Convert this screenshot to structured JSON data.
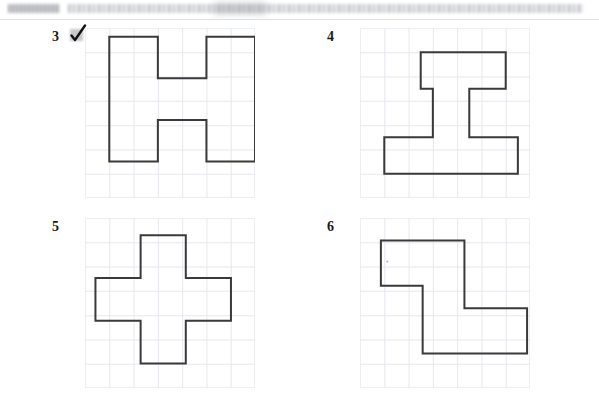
{
  "document": {
    "type": "scanned-worksheet",
    "page_background": "#ffffff",
    "header": {
      "redacted": true,
      "tag_band_label": "",
      "title_band_label": "",
      "note": "header text illegible in scan"
    },
    "ink_color": "#3a3a3a",
    "grid_line_color": "#e6e8ee",
    "grid_border_color": "#eceef3"
  },
  "annotations": {
    "check_mark": {
      "name": "check-mark",
      "near_item": "3",
      "color": "#111111",
      "highlight_color": "#787c82"
    }
  },
  "figures": [
    {
      "number": "3",
      "name": "letter-h-shape",
      "description": "Block capital letter H outlined on square grid",
      "grid": {
        "cols": 7,
        "rows": 7,
        "cell": 24
      },
      "polygon": [
        [
          1,
          1
        ],
        [
          3,
          1
        ],
        [
          3,
          3
        ],
        [
          5,
          3
        ],
        [
          5,
          1
        ],
        [
          7,
          1
        ],
        [
          7,
          8
        ],
        [
          5,
          8
        ],
        [
          5,
          5
        ],
        [
          3,
          5
        ],
        [
          3,
          8
        ],
        [
          1,
          8
        ]
      ],
      "units": {
        "area": 26,
        "perimeter": 28
      }
    },
    {
      "number": "4",
      "name": "i-beam-shape",
      "description": "Asymmetric I-beam / capital I with offset narrow top bar and wide base",
      "grid": {
        "cols": 7,
        "rows": 7,
        "cell": 24
      },
      "polygon": [
        [
          3,
          2
        ],
        [
          8,
          2
        ],
        [
          8,
          5
        ],
        [
          6,
          5
        ],
        [
          6,
          9
        ],
        [
          9,
          9
        ],
        [
          9,
          12
        ],
        [
          1,
          12
        ],
        [
          1,
          9
        ],
        [
          4,
          9
        ],
        [
          4,
          5
        ],
        [
          3,
          5
        ]
      ],
      "units": {
        "area": 30,
        "perimeter": 34
      }
    },
    {
      "number": "5",
      "name": "plus-cross-shape",
      "description": "Symmetric plus / cross outlined on square grid",
      "grid": {
        "cols": 7,
        "rows": 7,
        "cell": 24
      },
      "polygon": [
        [
          3,
          1
        ],
        [
          5,
          1
        ],
        [
          5,
          3
        ],
        [
          7,
          3
        ],
        [
          7,
          5
        ],
        [
          5,
          5
        ],
        [
          5,
          7
        ],
        [
          3,
          7
        ],
        [
          3,
          5
        ],
        [
          1,
          5
        ],
        [
          1,
          3
        ],
        [
          3,
          3
        ]
      ],
      "units": {
        "area": 20,
        "perimeter": 24
      }
    },
    {
      "number": "6",
      "name": "z-zigzag-shape",
      "description": "Z / S shaped zigzag hexomino outlined on square grid",
      "grid": {
        "cols": 7,
        "rows": 7,
        "cell": 24
      },
      "polygon": [
        [
          1,
          1
        ],
        [
          5,
          1
        ],
        [
          5,
          5
        ],
        [
          8,
          5
        ],
        [
          8,
          7
        ],
        [
          3,
          7
        ],
        [
          3,
          3
        ],
        [
          1,
          3
        ]
      ],
      "units": {
        "area": 22,
        "perimeter": 28
      }
    }
  ]
}
